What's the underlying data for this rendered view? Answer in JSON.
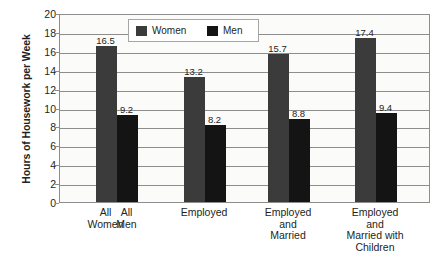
{
  "chart_data": {
    "type": "bar",
    "title": "",
    "subtitle": "",
    "xlabel": "",
    "ylabel": "Hours of Housework per Week",
    "ylim": [
      0,
      20
    ],
    "ytick_step": 2,
    "yticks": [
      "20",
      "18",
      "16",
      "14",
      "12",
      "10",
      "8",
      "6",
      "4",
      "2",
      "0"
    ],
    "grid": true,
    "legend_position": "top-center",
    "categories": [
      "All\nWomen / All\nMen",
      "Employed",
      "Employed\nand\nMarried",
      "Employed and\nMarried with\nChildren"
    ],
    "category_labels": [
      {
        "text": "All\nWomen",
        "group": 0,
        "bar": "Women"
      },
      {
        "text": "All\nMen",
        "group": 0,
        "bar": "Men"
      },
      {
        "text": "Employed",
        "group": 1,
        "bar": "both"
      },
      {
        "text": "Employed\nand\nMarried",
        "group": 2,
        "bar": "both"
      },
      {
        "text": "Employed and\nMarried with\nChildren",
        "group": 3,
        "bar": "both"
      }
    ],
    "series": [
      {
        "name": "Women",
        "color": "#3b3b3b",
        "values": [
          16.5,
          13.2,
          15.7,
          17.4
        ]
      },
      {
        "name": "Men",
        "color": "#141414",
        "values": [
          9.2,
          8.2,
          8.8,
          9.4
        ]
      }
    ],
    "value_labels": {
      "women": [
        "16.5",
        "13.2",
        "15.7",
        "17.4"
      ],
      "men": [
        "9.2",
        "8.2",
        "8.8",
        "9.4"
      ]
    },
    "legend": [
      {
        "label": "Women",
        "color": "#3b3b3b"
      },
      {
        "label": "Men",
        "color": "#141414"
      }
    ]
  },
  "colors": {
    "women_bar": "#3b3b3b",
    "men_bar": "#141414",
    "gridline": "#8d8d8d",
    "plot_background": "#fbfbfa",
    "text": "#231f20"
  }
}
